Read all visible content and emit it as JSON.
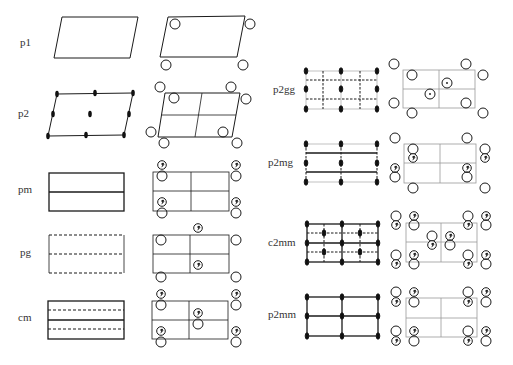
{
  "colors": {
    "line": "#1a1a1a",
    "grid": "#888888",
    "background": "#ffffff"
  },
  "groups": [
    {
      "id": "p1",
      "label": "p1",
      "column": "left",
      "lattice": "oblique"
    },
    {
      "id": "p2",
      "label": "p2",
      "column": "left",
      "lattice": "oblique"
    },
    {
      "id": "pm",
      "label": "pm",
      "column": "left",
      "lattice": "rectangular"
    },
    {
      "id": "pg",
      "label": "pg",
      "column": "left",
      "lattice": "rectangular"
    },
    {
      "id": "cm",
      "label": "cm",
      "column": "left",
      "lattice": "rectangular-centered"
    },
    {
      "id": "p2gg",
      "label": "p2gg",
      "column": "right",
      "lattice": "rectangular"
    },
    {
      "id": "p2mg",
      "label": "p2mg",
      "column": "right",
      "lattice": "rectangular"
    },
    {
      "id": "c2mm",
      "label": "c2mm",
      "column": "right",
      "lattice": "rectangular-centered"
    },
    {
      "id": "p2mm",
      "label": "p2mm",
      "column": "right",
      "lattice": "rectangular"
    }
  ],
  "legend_symbols": {
    "rotation_2fold": "filled-ellipse",
    "mirror": "solid-line",
    "glide": "dashed-line",
    "motif": "open-circle",
    "motif_mirrored": "circle-with-comma"
  }
}
